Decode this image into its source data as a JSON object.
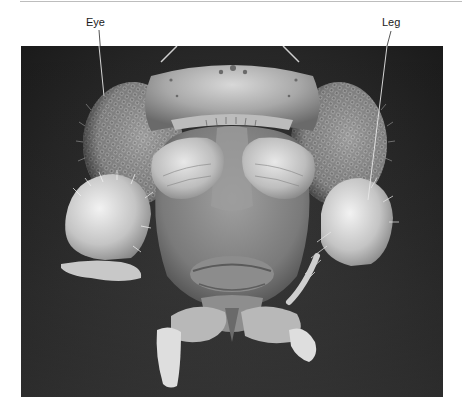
{
  "figure": {
    "type": "scanning electron micrograph",
    "labels": [
      {
        "id": "eye",
        "text": "Eye"
      },
      {
        "id": "leg",
        "text": "Leg"
      }
    ]
  },
  "colors": {
    "background": "#ffffff",
    "micrograph_background": "#1a1a1a",
    "label_text": "#1a1a1a",
    "leader_line": "#e8e8e8",
    "top_rule": "#bdbdbd"
  }
}
